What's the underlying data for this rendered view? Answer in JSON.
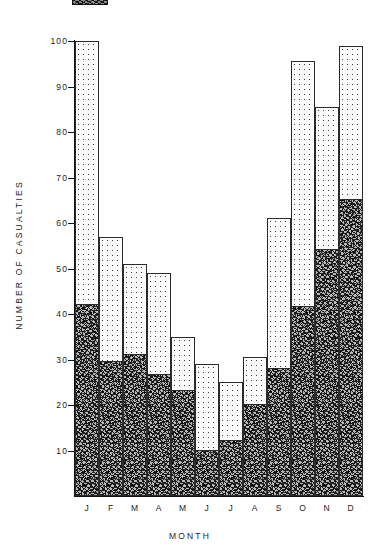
{
  "figure": {
    "legend_fragment_label": "legend-key-fragment"
  },
  "axes": {
    "y_title": "NUMBER OF CASUALTIES",
    "x_title": "MONTH",
    "y_ticks": [
      "10",
      "20",
      "30",
      "40",
      "50",
      "60",
      "70",
      "80",
      "90",
      "100"
    ],
    "x_ticks": [
      "J",
      "F",
      "M",
      "A",
      "M",
      "J",
      "J",
      "A",
      "S",
      "O",
      "N",
      "D"
    ]
  },
  "chart_data": {
    "type": "bar",
    "title": "",
    "subtitle": "",
    "xlabel": "MONTH",
    "ylabel": "NUMBER OF CASUALTIES",
    "ylim": [
      0,
      100
    ],
    "xlim_categories": 12,
    "grid": false,
    "legend_position": "top-left-clipped",
    "stacked": true,
    "categories": [
      "J",
      "F",
      "M",
      "A",
      "M",
      "J",
      "J",
      "A",
      "S",
      "O",
      "N",
      "D"
    ],
    "category_names": [
      "January",
      "February",
      "March",
      "April",
      "May",
      "June",
      "July",
      "August",
      "September",
      "October",
      "November",
      "December"
    ],
    "series": [
      {
        "name": "lower-segment",
        "fill": "dense-crosshatch",
        "values": [
          42,
          29.5,
          31,
          26.5,
          23,
          10,
          12,
          20,
          28,
          41.5,
          54,
          65
        ]
      },
      {
        "name": "upper-segment",
        "fill": "stipple-dots",
        "values": [
          58,
          27.5,
          20,
          22.5,
          12,
          19,
          13,
          10.5,
          33,
          54,
          31.5,
          34
        ]
      }
    ],
    "totals": [
      100,
      57,
      51,
      49,
      35,
      29,
      25,
      30.5,
      61,
      95.5,
      85.5,
      99
    ],
    "colors": {
      "upper_fill": "#fcfcfc",
      "lower_fill": "#b9b9b9",
      "outline": "#2b2b2b",
      "axis": "#111111",
      "text": "#1d1d1d"
    }
  }
}
